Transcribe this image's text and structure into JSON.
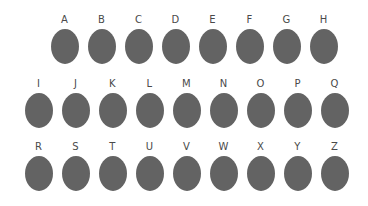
{
  "canvas": {
    "width": 368,
    "height": 206,
    "background_color": "#ffffff"
  },
  "style": {
    "ellipse_fill": "#636363",
    "label_color": "#4a4a4a",
    "ellipse_width": 28,
    "ellipse_height": 35,
    "column_pitch": 37,
    "label_font_size": 10,
    "label_gap": 4
  },
  "rows": [
    {
      "id": "row-1",
      "left": 46,
      "label_top": 14,
      "items": [
        {
          "label": "A"
        },
        {
          "label": "B"
        },
        {
          "label": "C"
        },
        {
          "label": "D"
        },
        {
          "label": "E"
        },
        {
          "label": "F"
        },
        {
          "label": "G"
        },
        {
          "label": "H"
        }
      ]
    },
    {
      "id": "row-2",
      "left": 20,
      "label_top": 78,
      "items": [
        {
          "label": "I"
        },
        {
          "label": "J"
        },
        {
          "label": "K"
        },
        {
          "label": "L"
        },
        {
          "label": "M"
        },
        {
          "label": "N"
        },
        {
          "label": "O"
        },
        {
          "label": "P"
        },
        {
          "label": "Q"
        }
      ]
    },
    {
      "id": "row-3",
      "left": 20,
      "label_top": 141,
      "items": [
        {
          "label": "R"
        },
        {
          "label": "S"
        },
        {
          "label": "T"
        },
        {
          "label": "U"
        },
        {
          "label": "V"
        },
        {
          "label": "W"
        },
        {
          "label": "X"
        },
        {
          "label": "Y"
        },
        {
          "label": "Z"
        }
      ]
    }
  ]
}
